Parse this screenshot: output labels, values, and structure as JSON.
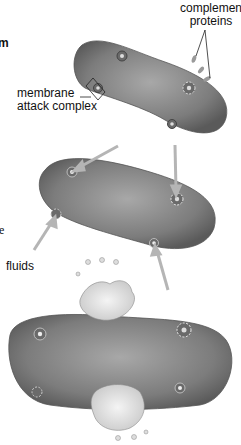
{
  "labels": {
    "fragment_top": "m",
    "complement_proteins_1": "complement",
    "complement_proteins_2": "proteins",
    "mac_1": "membrane",
    "mac_2": "attack complex",
    "fragment_mid": "e",
    "fluids": "fluids"
  },
  "figure": {
    "panels": [
      "complement proteins binding",
      "pore formation / fluids entering",
      "cell bursting"
    ],
    "cell_color": "#7a7a7a",
    "arrow_color": "#b5b5b5"
  }
}
